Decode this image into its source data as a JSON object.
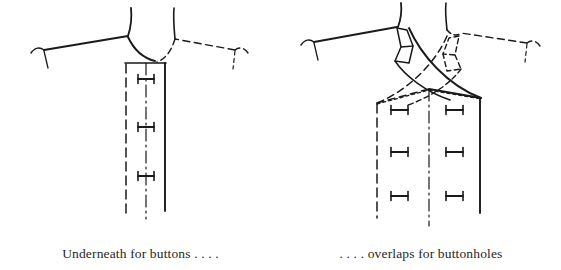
{
  "page": {
    "background_color": "#ffffff",
    "ink_color": "#1a1a1a",
    "width": 561,
    "height": 270
  },
  "figures": [
    {
      "id": "left",
      "name": "underneath-for-buttons",
      "caption": "Underneath for buttons . . . .",
      "description": "Front bodice with straight centre placket; left half drawn solid, right half drawn dashed",
      "button_marks": 3,
      "placket": {
        "style": "straight",
        "left_edge": "dashed",
        "centre_line": "dash-dot",
        "right_edge": "solid"
      }
    },
    {
      "id": "right",
      "name": "overlaps-for-buttonholes",
      "caption": ". . . . overlaps for buttonholes",
      "description": "Front bodice with crossed-over wrap fronts; left half solid, right half dashed, six buttonhole marks",
      "button_marks": 6,
      "placket": {
        "style": "crossover",
        "left_edge": "dashed",
        "centre_line": "dash-dot",
        "right_edge": "solid"
      }
    }
  ],
  "captions": {
    "left": "Underneath for buttons . . . .",
    "right": ". . . . overlaps for buttonholes"
  }
}
